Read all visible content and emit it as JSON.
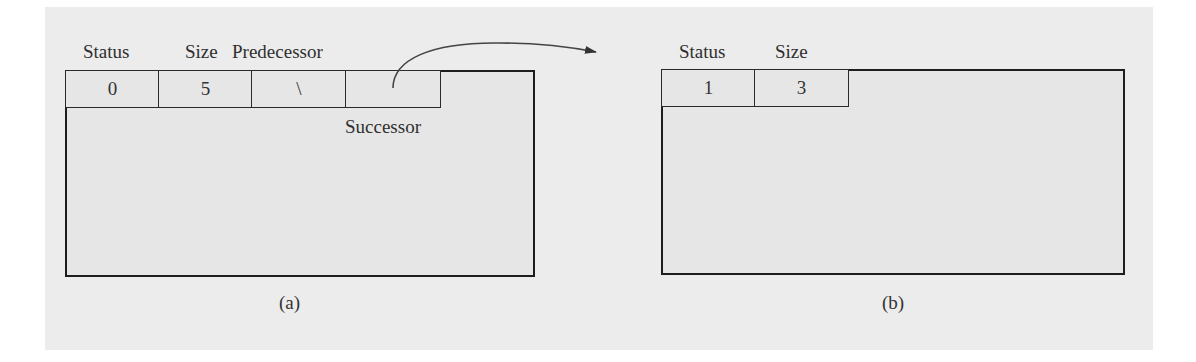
{
  "diagram": {
    "colors": {
      "background": "#ececec",
      "box_fill": "#e6e6e6",
      "stroke": "#1e1e1e"
    },
    "panel_a": {
      "caption": "(a)",
      "header_labels": [
        "Status",
        "Size",
        "Predecessor"
      ],
      "cells": [
        {
          "field": "Status",
          "value": "0"
        },
        {
          "field": "Size",
          "value": "5"
        },
        {
          "field": "Predecessor",
          "value": "\\"
        },
        {
          "field": "Successor",
          "value": ""
        }
      ],
      "successor_label": "Successor",
      "arrow": "Successor pointer arrow to block (b)"
    },
    "panel_b": {
      "caption": "(b)",
      "header_labels": [
        "Status",
        "Size"
      ],
      "cells": [
        {
          "field": "Status",
          "value": "1"
        },
        {
          "field": "Size",
          "value": "3"
        }
      ]
    }
  }
}
